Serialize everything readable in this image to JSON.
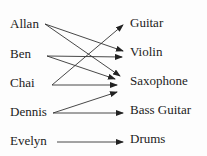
{
  "people": [
    {
      "name": "Allan",
      "x": 10,
      "y": 17
    },
    {
      "name": "Ben",
      "x": 10,
      "y": 47
    },
    {
      "name": "Chai",
      "x": 10,
      "y": 76
    },
    {
      "name": "Dennis",
      "x": 10,
      "y": 105
    },
    {
      "name": "Evelyn",
      "x": 10,
      "y": 134
    }
  ],
  "instruments": [
    {
      "name": "Guitar",
      "x": 130,
      "y": 16
    },
    {
      "name": "Violin",
      "x": 130,
      "y": 45
    },
    {
      "name": "Saxophone",
      "x": 130,
      "y": 74
    },
    {
      "name": "Bass Guitar",
      "x": 130,
      "y": 103
    },
    {
      "name": "Drums",
      "x": 130,
      "y": 132
    }
  ],
  "mappings": [
    {
      "from": "Allan",
      "to": "Violin",
      "x1": 45,
      "y1": 24,
      "x2": 123,
      "y2": 51
    },
    {
      "from": "Allan",
      "to": "Saxophone",
      "x1": 45,
      "y1": 24,
      "x2": 120,
      "y2": 76
    },
    {
      "from": "Ben",
      "to": "Violin",
      "x1": 47,
      "y1": 56,
      "x2": 122,
      "y2": 57
    },
    {
      "from": "Ben",
      "to": "Saxophone",
      "x1": 47,
      "y1": 56,
      "x2": 115,
      "y2": 79
    },
    {
      "from": "Chai",
      "to": "Guitar",
      "x1": 52,
      "y1": 85,
      "x2": 123,
      "y2": 25
    },
    {
      "from": "Chai",
      "to": "Saxophone",
      "x1": 52,
      "y1": 85,
      "x2": 117,
      "y2": 85
    },
    {
      "from": "Dennis",
      "to": "Saxophone",
      "x1": 53,
      "y1": 113,
      "x2": 117,
      "y2": 92
    },
    {
      "from": "Dennis",
      "to": "Bass Guitar",
      "x1": 53,
      "y1": 113,
      "x2": 123,
      "y2": 113
    },
    {
      "from": "Evelyn",
      "to": "Drums",
      "x1": 57,
      "y1": 142,
      "x2": 123,
      "y2": 142
    }
  ],
  "colors": {
    "line": "#333333",
    "text": "#222222"
  }
}
